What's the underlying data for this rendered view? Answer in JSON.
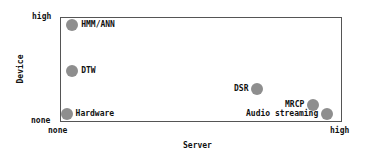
{
  "chart_data": {
    "type": "scatter",
    "title": "",
    "xlabel": "Server",
    "ylabel": "Device",
    "x_ticks": [
      "none",
      "high"
    ],
    "y_ticks": [
      "none",
      "high"
    ],
    "xlim": [
      0,
      1
    ],
    "ylim": [
      0,
      1
    ],
    "grid": false,
    "legend": null,
    "points": [
      {
        "label": "HMM/ANN",
        "x": 0.04,
        "y": 0.93,
        "label_side": "right"
      },
      {
        "label": "DTW",
        "x": 0.04,
        "y": 0.49,
        "label_side": "right"
      },
      {
        "label": "Hardware",
        "x": 0.02,
        "y": 0.07,
        "label_side": "right"
      },
      {
        "label": "DSR",
        "x": 0.7,
        "y": 0.31,
        "label_side": "left"
      },
      {
        "label": "MRCP",
        "x": 0.9,
        "y": 0.16,
        "label_side": "left"
      },
      {
        "label": "Audio streaming",
        "x": 0.95,
        "y": 0.07,
        "label_side": "left"
      }
    ],
    "marker_color": "#8e8e8e"
  },
  "axes": {
    "x_label": "Server",
    "y_label": "Device",
    "x_min_tick": "none",
    "x_max_tick": "high",
    "y_min_tick": "none",
    "y_max_tick": "high"
  }
}
